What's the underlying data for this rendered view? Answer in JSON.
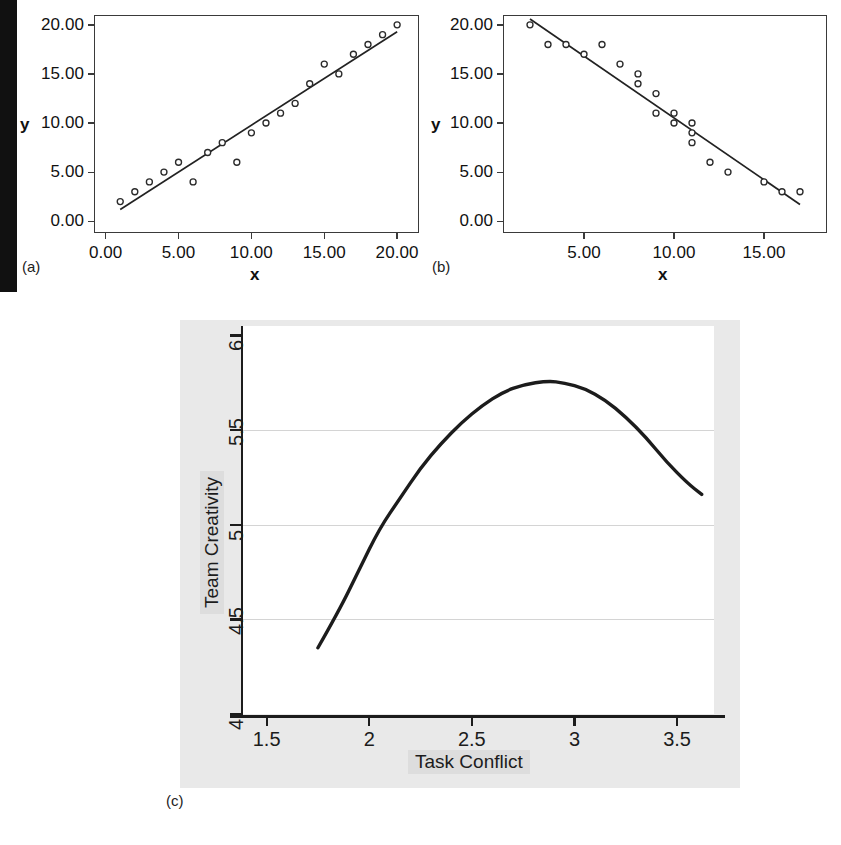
{
  "figure": {
    "panels": [
      {
        "key": "a",
        "letter": "(a)"
      },
      {
        "key": "b",
        "letter": "(b)"
      },
      {
        "key": "c",
        "letter": "(c)"
      }
    ]
  },
  "chart_data": [
    {
      "panel": "(a)",
      "type": "scatter",
      "title": "",
      "xlabel": "x",
      "ylabel": "y",
      "xlim": [
        -0.8,
        21.5
      ],
      "ylim": [
        -1.2,
        21.0
      ],
      "xticks": [
        "0.00",
        "5.00",
        "10.00",
        "15.00",
        "20.00"
      ],
      "xtick_values": [
        0,
        5,
        10,
        15,
        20
      ],
      "yticks": [
        "0.00",
        "5.00",
        "10.00",
        "15.00",
        "20.00"
      ],
      "ytick_values": [
        0,
        5,
        10,
        15,
        20
      ],
      "grid": false,
      "legend": "none",
      "description": "Positive linear relationship with fitted regression line",
      "points": [
        {
          "x": 1,
          "y": 2
        },
        {
          "x": 2,
          "y": 3
        },
        {
          "x": 3,
          "y": 4
        },
        {
          "x": 4,
          "y": 5
        },
        {
          "x": 5,
          "y": 6
        },
        {
          "x": 6,
          "y": 4
        },
        {
          "x": 7,
          "y": 7
        },
        {
          "x": 8,
          "y": 8
        },
        {
          "x": 9,
          "y": 6
        },
        {
          "x": 10,
          "y": 9
        },
        {
          "x": 11,
          "y": 10
        },
        {
          "x": 12,
          "y": 11
        },
        {
          "x": 13,
          "y": 12
        },
        {
          "x": 14,
          "y": 14
        },
        {
          "x": 15,
          "y": 16
        },
        {
          "x": 16,
          "y": 15
        },
        {
          "x": 17,
          "y": 17
        },
        {
          "x": 18,
          "y": 18
        },
        {
          "x": 19,
          "y": 19
        },
        {
          "x": 20,
          "y": 20
        }
      ],
      "fit_line": {
        "x1": 1,
        "y1": 1.2,
        "x2": 20,
        "y2": 19.3
      }
    },
    {
      "panel": "(b)",
      "type": "scatter",
      "title": "",
      "xlabel": "x",
      "ylabel": "y",
      "xlim": [
        0.5,
        18.5
      ],
      "ylim": [
        -1.2,
        21.0
      ],
      "xticks": [
        "5.00",
        "10.00",
        "15.00"
      ],
      "xtick_values": [
        5,
        10,
        15
      ],
      "yticks": [
        "0.00",
        "5.00",
        "10.00",
        "15.00",
        "20.00"
      ],
      "ytick_values": [
        0,
        5,
        10,
        15,
        20
      ],
      "grid": false,
      "legend": "none",
      "description": "Negative linear relationship with fitted regression line",
      "points": [
        {
          "x": 2,
          "y": 20
        },
        {
          "x": 3,
          "y": 18
        },
        {
          "x": 4,
          "y": 18
        },
        {
          "x": 5,
          "y": 17
        },
        {
          "x": 6,
          "y": 18
        },
        {
          "x": 7,
          "y": 16
        },
        {
          "x": 8,
          "y": 15
        },
        {
          "x": 8,
          "y": 14
        },
        {
          "x": 9,
          "y": 13
        },
        {
          "x": 9,
          "y": 11
        },
        {
          "x": 10,
          "y": 11
        },
        {
          "x": 10,
          "y": 10
        },
        {
          "x": 11,
          "y": 10
        },
        {
          "x": 11,
          "y": 9
        },
        {
          "x": 11,
          "y": 8
        },
        {
          "x": 12,
          "y": 6
        },
        {
          "x": 13,
          "y": 5
        },
        {
          "x": 15,
          "y": 4
        },
        {
          "x": 16,
          "y": 3
        },
        {
          "x": 17,
          "y": 3
        }
      ],
      "fit_line": {
        "x1": 2,
        "y1": 20.6,
        "x2": 17,
        "y2": 1.7
      }
    },
    {
      "panel": "(c)",
      "type": "line",
      "title": "",
      "xlabel": "Task Conflict",
      "ylabel": "Team Creativity",
      "xlim": [
        1.38,
        3.68
      ],
      "ylim": [
        4.0,
        6.05
      ],
      "xticks": [
        "1.5",
        "2",
        "2.5",
        "3",
        "3.5"
      ],
      "xtick_values": [
        1.5,
        2,
        2.5,
        3,
        3.5
      ],
      "yticks": [
        "4",
        "4.5",
        "5",
        "5.5",
        "6"
      ],
      "ytick_values": [
        4,
        4.5,
        5,
        5.5,
        6
      ],
      "grid": true,
      "grid_axis": "y",
      "legend": "none",
      "description": "Inverted U-shaped (curvilinear) relationship between task conflict and team creativity; peak near x = 2.87",
      "curve": [
        {
          "x": 1.75,
          "y": 4.35
        },
        {
          "x": 1.85,
          "y": 4.54
        },
        {
          "x": 1.95,
          "y": 4.76
        },
        {
          "x": 2.05,
          "y": 4.98
        },
        {
          "x": 2.15,
          "y": 5.14
        },
        {
          "x": 2.25,
          "y": 5.3
        },
        {
          "x": 2.35,
          "y": 5.43
        },
        {
          "x": 2.45,
          "y": 5.54
        },
        {
          "x": 2.55,
          "y": 5.63
        },
        {
          "x": 2.65,
          "y": 5.7
        },
        {
          "x": 2.75,
          "y": 5.74
        },
        {
          "x": 2.87,
          "y": 5.76
        },
        {
          "x": 2.95,
          "y": 5.75
        },
        {
          "x": 3.05,
          "y": 5.72
        },
        {
          "x": 3.15,
          "y": 5.66
        },
        {
          "x": 3.25,
          "y": 5.57
        },
        {
          "x": 3.35,
          "y": 5.46
        },
        {
          "x": 3.45,
          "y": 5.33
        },
        {
          "x": 3.55,
          "y": 5.22
        },
        {
          "x": 3.62,
          "y": 5.16
        }
      ]
    }
  ],
  "colors": {
    "ink": "#1a1a1a",
    "frame": "#3a3a3a",
    "panel_background": "#e9e9e9",
    "plot_background": "#ffffff",
    "gridline": "#d4d4d4",
    "scan_bar": "#111111",
    "label_highlight": "#dddddd"
  }
}
